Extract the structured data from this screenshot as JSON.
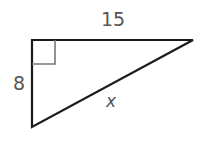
{
  "figure": {
    "type": "right-triangle",
    "stroke_color": "#1a1a1a",
    "label_color": "#555555",
    "right_angle_marker_color": "#777777",
    "vertices": {
      "right_angle": [
        32,
        40
      ],
      "top_right": [
        193,
        40
      ],
      "bottom_left": [
        32,
        127
      ]
    },
    "labels": {
      "top_leg": "15",
      "left_leg": "8",
      "hypotenuse": "x"
    }
  }
}
